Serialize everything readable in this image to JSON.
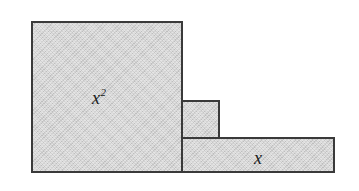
{
  "figure": {
    "canvas": {
      "width": 359,
      "height": 191,
      "background_color": "#ffffff"
    },
    "style": {
      "fill_color": "#d2d2d2",
      "stroke_color": "#3a3a3a",
      "stroke_width": 2,
      "text_color": "#1a1a1a"
    },
    "shapes": [
      {
        "id": "x-squared-region",
        "name": "large-square",
        "x": 31,
        "y": 21,
        "width": 152,
        "height": 152,
        "fill": "#d2d2d2",
        "stroke": "#3a3a3a"
      },
      {
        "id": "small-square-region",
        "name": "small-square",
        "x": 181,
        "y": 100,
        "width": 39,
        "height": 39,
        "fill": "#d2d2d2",
        "stroke": "#3a3a3a"
      },
      {
        "id": "x-bar-region",
        "name": "horizontal-bar",
        "x": 181,
        "y": 137,
        "width": 154,
        "height": 36,
        "fill": "#d2d2d2",
        "stroke": "#3a3a3a"
      }
    ],
    "labels": {
      "x_squared": {
        "base": "x",
        "exponent": "2",
        "full_text": "x²"
      },
      "x": {
        "text": "x"
      }
    }
  }
}
